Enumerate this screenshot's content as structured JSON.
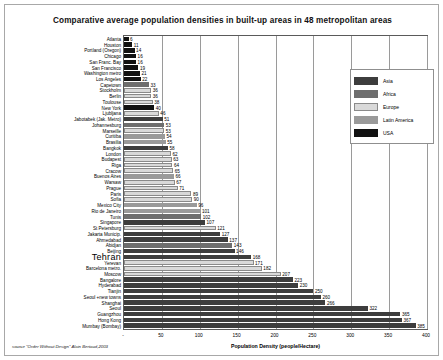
{
  "chart_data": {
    "type": "bar",
    "orientation": "horizontal",
    "title": "Comparative  average population densities in built-up areas in 48 metropolitan areas",
    "xlabel": "Population Density (people/Hectare)",
    "ylabel": "",
    "xlim": [
      0,
      400
    ],
    "xticks": [
      0,
      50,
      100,
      150,
      200,
      250,
      300,
      350,
      400
    ],
    "xtick_labels": [
      "-",
      "50",
      "100",
      "150",
      "200",
      "250",
      "300",
      "350",
      "400"
    ],
    "grid": true,
    "legend_position": "right",
    "source": "source \"Order Without Design\" Alain Bertaud,2003",
    "legend": [
      {
        "name": "Asia",
        "color": "#3d3d3d"
      },
      {
        "name": "Africa",
        "color": "#6e6e6e"
      },
      {
        "name": "Europe",
        "color": "#d9d9d9"
      },
      {
        "name": "Latin America",
        "color": "#9a9a9a"
      },
      {
        "name": "USA",
        "color": "#111111"
      }
    ],
    "categories": [
      "Atlanta",
      "Houston",
      "Portland (Oregon)",
      "Chicago",
      "San Franc. Bay",
      "San Francisco",
      "Washington metro",
      "Los Angeles",
      "Capetown",
      "Stockholm",
      "Berlin",
      "Toulouse",
      "New York",
      "Ljubljana",
      "Jabotabek (Jak. Metro)",
      "Johannesburg",
      "Marseille",
      "Curitiba",
      "Brasilia",
      "Bangkok",
      "London",
      "Budapest",
      "Riga",
      "Cracow",
      "Buenos Aires",
      "Warsaw",
      "Prague",
      "Paris",
      "Sofia",
      "Mexico City",
      "Rio de Janeiro",
      "Tunis",
      "Singapore",
      "St Petersburg",
      "Jakarta Municip.",
      "Ahmedabad",
      "Abidjan",
      "Beijing",
      "Tehran",
      "Yerevan",
      "Barcelona metro.",
      "Moscow",
      "Bangalore",
      "Hyderabad",
      "Tianjin",
      "Seoul +new towns",
      "Shanghai",
      "Seoul",
      "Guangzhou",
      "Hong Kong",
      "Mumbay (Bombay)"
    ],
    "values": [
      6,
      11,
      14,
      16,
      16,
      19,
      21,
      22,
      33,
      36,
      36,
      38,
      40,
      46,
      51,
      53,
      53,
      54,
      55,
      58,
      62,
      63,
      64,
      65,
      66,
      67,
      71,
      89,
      90,
      96,
      101,
      102,
      107,
      121,
      127,
      137,
      143,
      146,
      168,
      171,
      182,
      207,
      223,
      230,
      250,
      260,
      266,
      322,
      365,
      367,
      385
    ],
    "regions": [
      "usa",
      "usa",
      "usa",
      "usa",
      "usa",
      "usa",
      "usa",
      "usa",
      "africa",
      "europe",
      "europe",
      "europe",
      "usa",
      "europe",
      "asia",
      "africa",
      "europe",
      "latin",
      "latin",
      "asia",
      "europe",
      "europe",
      "europe",
      "europe",
      "latin",
      "europe",
      "europe",
      "europe",
      "europe",
      "latin",
      "latin",
      "africa",
      "asia",
      "europe",
      "asia",
      "asia",
      "africa",
      "asia",
      "asia",
      "europe",
      "europe",
      "europe",
      "asia",
      "asia",
      "asia",
      "asia",
      "asia",
      "asia",
      "asia",
      "asia",
      "asia"
    ],
    "highlight": "Tehran"
  }
}
